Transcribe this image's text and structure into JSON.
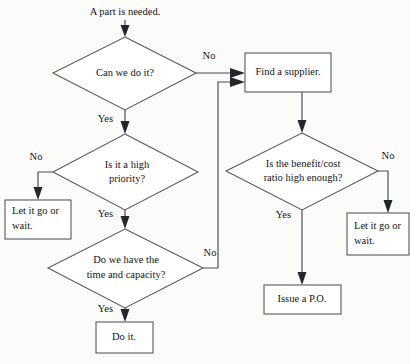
{
  "diagram": {
    "title": "A part is needed.",
    "background_color": "#fbfbfa",
    "line_color": "#4b5053",
    "text_color": "#141414",
    "start": {
      "label": "A part is needed."
    },
    "decisions": [
      {
        "id": "can-we-do-it",
        "line1": "Can we do it?",
        "line2": "",
        "yes_label": "Yes",
        "no_label": "No"
      },
      {
        "id": "is-it-a-high-priority",
        "line1": "Is it a high",
        "line2": "priority?",
        "yes_label": "Yes",
        "no_label": "No"
      },
      {
        "id": "do-we-have-time-and-capacity",
        "line1": "Do we have the",
        "line2": "time and capacity?",
        "yes_label": "Yes",
        "no_label": "No"
      },
      {
        "id": "is-benefit-cost-ratio-high-enough",
        "line1": "Is the benefit/cost",
        "line2": "ratio high enough?",
        "yes_label": "Yes",
        "no_label": "No"
      }
    ],
    "processes": [
      {
        "id": "find-a-supplier",
        "line1": "Find a supplier.",
        "line2": ""
      },
      {
        "id": "let-it-go-or-wait-left",
        "line1": "Let it go or",
        "line2": "wait."
      },
      {
        "id": "let-it-go-or-wait-right",
        "line1": "Let it go or",
        "line2": "wait."
      },
      {
        "id": "issue-a-po",
        "line1": "Issue a P.O.",
        "line2": ""
      },
      {
        "id": "do-it",
        "line1": "Do it.",
        "line2": ""
      }
    ],
    "edge_labels": {
      "can_we_do_it_no": "No",
      "can_we_do_it_yes": "Yes",
      "priority_no": "No",
      "priority_yes": "Yes",
      "capacity_no": "No",
      "capacity_yes": "Yes",
      "benefit_no": "No",
      "benefit_yes": "Yes"
    }
  }
}
